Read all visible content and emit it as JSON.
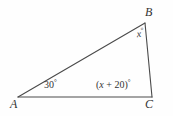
{
  "figure": {
    "type": "triangle-diagram",
    "background_color": "#fefefe",
    "stroke_color": "#4a4a4a",
    "text_color": "#333333",
    "vertices": {
      "a": {
        "label": "A",
        "x": 18,
        "y": 97
      },
      "b": {
        "label": "B",
        "x": 145,
        "y": 23
      },
      "c": {
        "label": "C",
        "x": 152,
        "y": 97
      }
    },
    "angles": {
      "at_a": {
        "text": "30°",
        "value": "30",
        "unit": "°"
      },
      "at_b": {
        "variable": "x",
        "unit": "°",
        "text": "x°"
      },
      "at_c": {
        "expression": "(x + 20)",
        "unit": "°",
        "text": "(x + 20)°"
      }
    },
    "sides": [
      {
        "name": "side-ab",
        "from": "A",
        "to": "B"
      },
      {
        "name": "side-bc",
        "from": "B",
        "to": "C"
      },
      {
        "name": "side-ac",
        "from": "A",
        "to": "C"
      }
    ]
  }
}
